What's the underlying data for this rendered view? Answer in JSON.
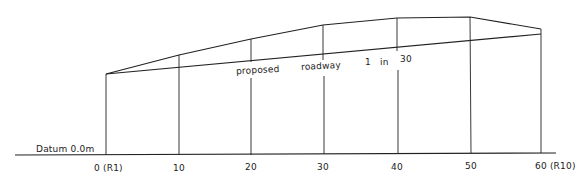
{
  "diagram": {
    "type": "longitudinal-section",
    "datum_label": "Datum  0.0m",
    "road_label": {
      "word1": "proposed",
      "word2": "roadway",
      "gradient_1": "1",
      "gradient_in": "in",
      "gradient_2": "30"
    },
    "stations": [
      {
        "label": "0 (R1)"
      },
      {
        "label": "10"
      },
      {
        "label": "20"
      },
      {
        "label": "30"
      },
      {
        "label": "40"
      },
      {
        "label": "50"
      },
      {
        "label": "60 (R10)"
      }
    ]
  }
}
